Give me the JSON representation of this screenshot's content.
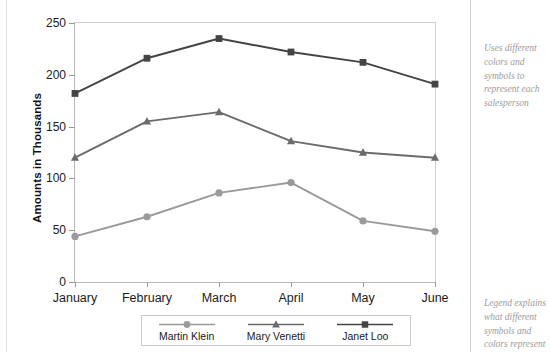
{
  "chart_data": {
    "type": "line",
    "title": "",
    "xlabel": "",
    "ylabel": "Amounts in Thousands",
    "categories": [
      "January",
      "February",
      "March",
      "April",
      "May",
      "June"
    ],
    "ylim": [
      0,
      250
    ],
    "yticks": [
      0,
      50,
      100,
      150,
      200,
      250
    ],
    "ytick_labels": [
      "0",
      "50",
      "100",
      "150",
      "200",
      "250"
    ],
    "grid": false,
    "legend_position": "bottom",
    "series": [
      {
        "name": "Martin Klein",
        "marker": "circle",
        "color": "#9a9a9a",
        "values": [
          44,
          63,
          86,
          96,
          59,
          49
        ]
      },
      {
        "name": "Mary Venetti",
        "marker": "triangle",
        "color": "#6b6b6b",
        "values": [
          120,
          155,
          164,
          136,
          125,
          120
        ]
      },
      {
        "name": "Janet Loo",
        "marker": "square",
        "color": "#444444",
        "values": [
          182,
          216,
          235,
          222,
          212,
          191
        ]
      }
    ]
  },
  "annotations": {
    "top": "Uses different colors and symbols to represent each salesperson",
    "bottom": "Legend explains what different symbols and colors represent"
  }
}
